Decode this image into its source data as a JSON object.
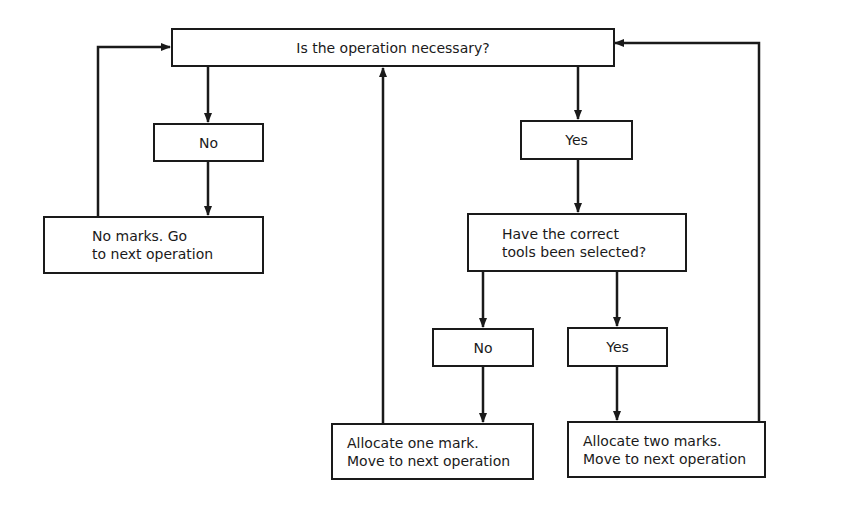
{
  "diagram": {
    "type": "flowchart",
    "nodes": {
      "start": {
        "label": "Is the operation necessary?"
      },
      "no_1": {
        "label": "No"
      },
      "yes_1": {
        "label": "Yes"
      },
      "no_marks": {
        "label": "No marks. Go\nto next operation"
      },
      "tools": {
        "label": "Have the correct\ntools been selected?"
      },
      "no_2": {
        "label": "No"
      },
      "yes_2": {
        "label": "Yes"
      },
      "one_mark": {
        "label": "Allocate one mark.\nMove to next operation"
      },
      "two_marks": {
        "label": "Allocate two marks.\nMove to next operation"
      }
    },
    "edges": [
      {
        "from": "start",
        "to": "no_1"
      },
      {
        "from": "start",
        "to": "yes_1"
      },
      {
        "from": "no_1",
        "to": "no_marks"
      },
      {
        "from": "no_marks",
        "to": "start"
      },
      {
        "from": "yes_1",
        "to": "tools"
      },
      {
        "from": "tools",
        "to": "no_2"
      },
      {
        "from": "tools",
        "to": "yes_2"
      },
      {
        "from": "no_2",
        "to": "one_mark"
      },
      {
        "from": "yes_2",
        "to": "two_marks"
      },
      {
        "from": "one_mark",
        "to": "start"
      },
      {
        "from": "two_marks",
        "to": "start"
      }
    ],
    "colors": {
      "line": "#1a1a1a",
      "background": "#ffffff"
    }
  }
}
